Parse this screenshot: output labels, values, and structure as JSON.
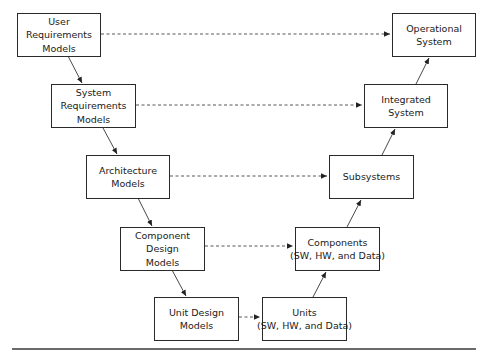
{
  "diagram": {
    "type": "V-model",
    "left_side": [
      {
        "id": "user_req",
        "lines": [
          "User",
          "Requirements",
          "Models"
        ]
      },
      {
        "id": "system_req",
        "lines": [
          "System",
          "Requirements",
          "Models"
        ]
      },
      {
        "id": "architecture",
        "lines": [
          "Architecture",
          "Models"
        ]
      },
      {
        "id": "component_design",
        "lines": [
          "Component",
          "Design",
          "Models"
        ]
      },
      {
        "id": "unit_design",
        "lines": [
          "Unit Design",
          "Models"
        ]
      }
    ],
    "right_side": [
      {
        "id": "units",
        "lines": [
          "Units",
          "(SW, HW, and Data)"
        ]
      },
      {
        "id": "components",
        "lines": [
          "Components",
          "(SW, HW, and Data)"
        ]
      },
      {
        "id": "subsystems",
        "lines": [
          "Subsystems"
        ]
      },
      {
        "id": "integrated",
        "lines": [
          "Integrated",
          "System"
        ]
      },
      {
        "id": "operational",
        "lines": [
          "Operational",
          "System"
        ]
      }
    ],
    "solid_arrows": [
      [
        "user_req",
        "system_req"
      ],
      [
        "system_req",
        "architecture"
      ],
      [
        "architecture",
        "component_design"
      ],
      [
        "component_design",
        "unit_design"
      ],
      [
        "units",
        "components"
      ],
      [
        "components",
        "subsystems"
      ],
      [
        "subsystems",
        "integrated"
      ],
      [
        "integrated",
        "operational"
      ]
    ],
    "dashed_arrows": [
      [
        "user_req",
        "operational"
      ],
      [
        "system_req",
        "integrated"
      ],
      [
        "architecture",
        "subsystems"
      ],
      [
        "component_design",
        "components"
      ],
      [
        "unit_design",
        "units"
      ]
    ]
  }
}
